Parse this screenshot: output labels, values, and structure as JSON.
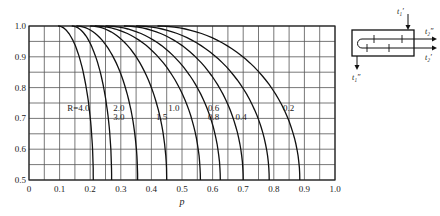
{
  "chart_data": {
    "type": "line",
    "title": "",
    "xlabel": "p",
    "ylabel": "",
    "xlim": [
      0,
      1.0
    ],
    "ylim": [
      0.5,
      1.0
    ],
    "grid": true,
    "grid_step_x": 0.05,
    "grid_step_y": 0.05,
    "x_ticks": [
      "0",
      "0.1",
      "0.2",
      "0.3",
      "0.4",
      "0.5",
      "0.6",
      "0.7",
      "0.8",
      "0.9",
      "1.0"
    ],
    "x_tick_values": [
      0,
      0.1,
      0.2,
      0.3,
      0.4,
      0.5,
      0.6,
      0.7,
      0.8,
      0.9,
      1.0
    ],
    "y_ticks": [
      "0.5",
      "0.6",
      "0.7",
      "0.8",
      "0.9",
      "1.0"
    ],
    "y_tick_values": [
      0.5,
      0.6,
      0.7,
      0.8,
      0.9,
      1.0
    ],
    "series": [
      {
        "name": "R=4.0",
        "label": "R=4.0",
        "start_p": 0.095,
        "end_p": 0.21,
        "label_at": [
          0.125,
          0.725
        ]
      },
      {
        "name": "R=3.0",
        "label": "3.0",
        "start_p": 0.14,
        "end_p": 0.27,
        "label_at": [
          0.275,
          0.695
        ]
      },
      {
        "name": "R=2.0",
        "label": "2.0",
        "start_p": 0.155,
        "end_p": 0.355,
        "label_at": [
          0.275,
          0.725
        ]
      },
      {
        "name": "R=1.5",
        "label": "1.5",
        "start_p": 0.2,
        "end_p": 0.45,
        "label_at": [
          0.415,
          0.695
        ]
      },
      {
        "name": "R=1.0",
        "label": "1.0",
        "start_p": 0.215,
        "end_p": 0.56,
        "label_at": [
          0.455,
          0.725
        ]
      },
      {
        "name": "R=0.8",
        "label": "0.8",
        "start_p": 0.25,
        "end_p": 0.625,
        "label_at": [
          0.585,
          0.695
        ]
      },
      {
        "name": "R=0.6",
        "label": "0.6",
        "start_p": 0.31,
        "end_p": 0.7,
        "label_at": [
          0.585,
          0.725
        ]
      },
      {
        "name": "R=0.4",
        "label": "0.4",
        "start_p": 0.35,
        "end_p": 0.785,
        "label_at": [
          0.675,
          0.695
        ]
      },
      {
        "name": "R=0.2",
        "label": "0.2",
        "start_p": 0.42,
        "end_p": 0.885,
        "label_at": [
          0.83,
          0.725
        ]
      }
    ]
  },
  "diagram": {
    "labels": {
      "t1_in": "t₁′",
      "t1_out": "t₁″",
      "t2_out": "t₂″",
      "t2_in": "t₂′"
    }
  }
}
